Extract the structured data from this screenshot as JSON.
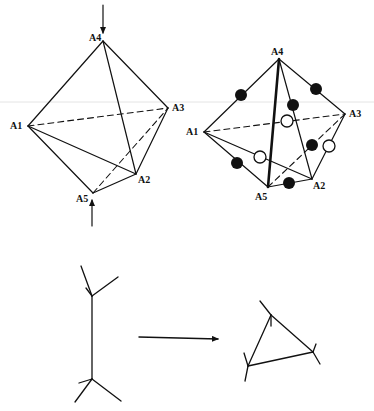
{
  "figure": {
    "left_octahedron": {
      "labels": {
        "A1": "A1",
        "A2": "A2",
        "A3": "A3",
        "A4": "A4",
        "A5": "A5"
      },
      "vertices": {
        "A1": [
          28,
          126
        ],
        "A2": [
          136,
          174
        ],
        "A3": [
          168,
          108
        ],
        "A4": [
          103,
          41
        ],
        "A5": [
          93,
          193
        ]
      },
      "solid_edges": [
        [
          "A4",
          "A1"
        ],
        [
          "A4",
          "A3"
        ],
        [
          "A4",
          "A2"
        ],
        [
          "A1",
          "A2"
        ],
        [
          "A1",
          "A5"
        ],
        [
          "A5",
          "A2"
        ],
        [
          "A2",
          "A3"
        ]
      ],
      "dashed_edges": [
        [
          "A1",
          "A3"
        ],
        [
          "A5",
          "A3"
        ]
      ],
      "arrows": [
        {
          "from": [
            103,
            5
          ],
          "to": [
            103,
            33
          ],
          "label": "compression-top"
        },
        {
          "from": [
            92,
            226
          ],
          "to": [
            92,
            200
          ],
          "label": "compression-bottom"
        }
      ]
    },
    "right_octahedron": {
      "labels": {
        "A1": "A1",
        "A2": "A2",
        "A3": "A3",
        "A4": "A4",
        "A5": "A5"
      },
      "vertices": {
        "A1": [
          204,
          132
        ],
        "A2": [
          312,
          179
        ],
        "A3": [
          345,
          114
        ],
        "A4": [
          279,
          59
        ],
        "A5": [
          268,
          187
        ]
      },
      "solid_edges": [
        [
          "A4",
          "A1"
        ],
        [
          "A4",
          "A3"
        ],
        [
          "A4",
          "A2"
        ],
        [
          "A1",
          "A2"
        ],
        [
          "A1",
          "A5"
        ],
        [
          "A5",
          "A2"
        ],
        [
          "A2",
          "A3"
        ]
      ],
      "bold_edges": [
        [
          "A4",
          "A5"
        ]
      ],
      "dashed_edges": [
        [
          "A1",
          "A3"
        ],
        [
          "A5",
          "A3"
        ]
      ],
      "filled_dots": [
        [
          241,
          95
        ],
        [
          316,
          89
        ],
        [
          293,
          105
        ],
        [
          312,
          145
        ],
        [
          237,
          163
        ],
        [
          289,
          183
        ]
      ],
      "open_dots": [
        [
          287,
          121
        ],
        [
          329,
          146
        ],
        [
          260,
          157
        ]
      ]
    },
    "bottom_left_graph": {
      "description": "Two trivalent vertices joined by a vertical edge",
      "lines": [
        [
          92,
          296,
          92,
          379
        ],
        [
          92,
          296,
          81,
          266
        ],
        [
          92,
          296,
          118,
          277
        ],
        [
          86,
          288,
          92,
          296
        ],
        [
          92,
          379,
          75,
          402
        ],
        [
          92,
          379,
          121,
          401
        ],
        [
          79,
          383,
          92,
          379
        ]
      ]
    },
    "transition_arrow": {
      "from": [
        139,
        337
      ],
      "to": [
        218,
        339
      ]
    },
    "bottom_right_graph": {
      "description": "Triangle with external legs",
      "lines": [
        [
          271,
          315,
          313,
          352
        ],
        [
          313,
          352,
          248,
          366
        ],
        [
          248,
          366,
          271,
          315
        ],
        [
          271,
          315,
          260,
          301
        ],
        [
          271,
          315,
          271,
          326
        ],
        [
          313,
          352,
          320,
          364
        ],
        [
          313,
          352,
          316,
          344
        ],
        [
          248,
          366,
          245,
          381
        ],
        [
          248,
          366,
          244,
          353
        ]
      ]
    },
    "colors": {
      "ink": "#111111",
      "background": "#ffffff",
      "scan_line": "#e4e4e4"
    }
  }
}
